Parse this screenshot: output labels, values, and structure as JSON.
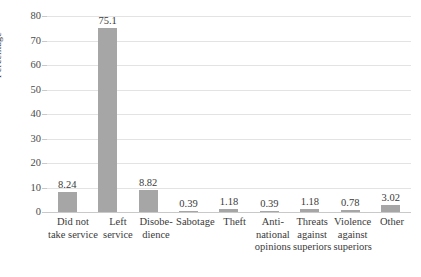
{
  "chart_data": {
    "type": "bar",
    "title": "",
    "xlabel": "",
    "ylabel": "Percentage",
    "ylim": [
      0,
      80
    ],
    "ytick_values": [
      80,
      70,
      60,
      50,
      40,
      30,
      20,
      10,
      0
    ],
    "grid": true,
    "legend": "none",
    "bar_color": "#a6a6a6",
    "gridline_color": "#e3e3e3",
    "categories": [
      "Did not take service",
      "Left service",
      "Disobedience",
      "Sabotage",
      "Theft",
      "Anti-national opinions",
      "Threats against superiors",
      "Violence against superiors",
      "Other"
    ],
    "category_lines": [
      [
        "Did not",
        "take service"
      ],
      [
        "Left",
        "service"
      ],
      [
        "Disobe-",
        "dience"
      ],
      [
        "Sabotage"
      ],
      [
        "Theft"
      ],
      [
        "Anti-",
        "national",
        "opinions"
      ],
      [
        "Threats",
        "against",
        "superiors"
      ],
      [
        "Violence",
        "against",
        "superiors"
      ],
      [
        "Other"
      ]
    ],
    "values": [
      8.24,
      75.1,
      8.82,
      0.39,
      1.18,
      0.39,
      1.18,
      0.78,
      3.02
    ],
    "value_labels": [
      "8.24",
      "75.1",
      "8.82",
      "0.39",
      "1.18",
      "0.39",
      "1.18",
      "0.78",
      "3.02"
    ]
  }
}
